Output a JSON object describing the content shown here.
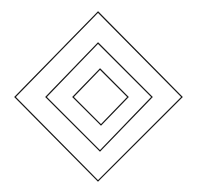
{
  "diagram": {
    "stroke_color": "#1a1a1a",
    "background": "#ffffff",
    "shapes": [
      {
        "name": "outer-diamond",
        "points": "98,12 182,97 98,181 15,97"
      },
      {
        "name": "middle-diamond",
        "points": "98,43 152,97 100,151 46,97"
      },
      {
        "name": "inner-diamond",
        "points": "100,69 128,97 101,125 73,97"
      }
    ]
  }
}
